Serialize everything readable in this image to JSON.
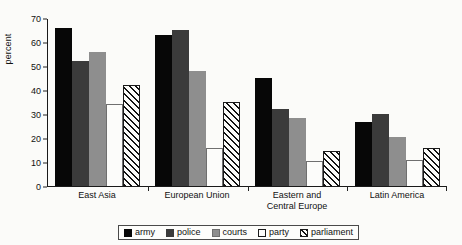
{
  "chart_data": {
    "type": "bar",
    "title": "",
    "xlabel": "",
    "ylabel": "percent",
    "ylim": [
      0,
      70
    ],
    "yticks": [
      0,
      10,
      20,
      30,
      40,
      50,
      60,
      70
    ],
    "grid": false,
    "legend_position": "bottom-center",
    "categories": [
      "East Asia",
      "European Union",
      "Eastern and Central Europe",
      "Latin America"
    ],
    "category_lines": [
      [
        "East Asia"
      ],
      [
        "European Union"
      ],
      [
        "Eastern and",
        "Central Europe"
      ],
      [
        "Latin America"
      ]
    ],
    "series": [
      {
        "name": "army",
        "key": "army",
        "color": "#070707",
        "values": [
          66,
          63,
          45,
          26.5
        ]
      },
      {
        "name": "police",
        "key": "police",
        "color": "#3b3b3b",
        "values": [
          52,
          65,
          32,
          30
        ]
      },
      {
        "name": "courts",
        "key": "courts",
        "color": "#8e8e8e",
        "values": [
          56,
          48,
          28.5,
          20.5
        ]
      },
      {
        "name": "party",
        "key": "party",
        "color": "#fcfcfa",
        "values": [
          34,
          16,
          10.5,
          11
        ]
      },
      {
        "name": "parliament",
        "key": "parliament",
        "color": "#hatch",
        "values": [
          42,
          35,
          14.5,
          16
        ]
      }
    ]
  },
  "legend": {
    "items": [
      {
        "label": "army",
        "key": "army"
      },
      {
        "label": "police",
        "key": "police"
      },
      {
        "label": "courts",
        "key": "courts"
      },
      {
        "label": "party",
        "key": "party"
      },
      {
        "label": "parliament",
        "key": "parliament"
      }
    ]
  }
}
